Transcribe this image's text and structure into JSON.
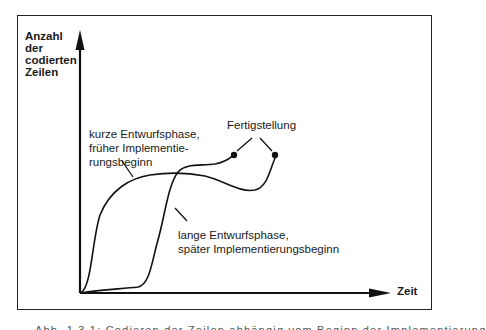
{
  "diagram": {
    "axes": {
      "y_label": "Anzahl der codierten Zeilen",
      "x_label": "Zeit"
    },
    "curves": [
      {
        "id": "kurze-entwurfsphase",
        "label": "kurze Entwurfsphase, früher Implementie-rungsbeginn",
        "label_lines": [
          "kurze Entwurfsphase,",
          "früher Implementie-",
          "rungsbeginn"
        ],
        "shape": "fast early rise, plateau with slight dip, then rise to completion"
      },
      {
        "id": "lange-entwurfsphase",
        "label": "lange Entwurfsphase, später Implementierungsbeginn",
        "label_lines": [
          "lange Entwurfsphase,",
          "später Implementierungsbeginn"
        ],
        "shape": "flat start, steep late rise, earlier completion"
      }
    ],
    "annotation": {
      "label": "Fertigstellung",
      "points": 2
    },
    "caption": "Abb. 1.3.1: Codieren der Zeilen abhängig vom Beginn der Implementierung"
  },
  "colors": {
    "line": "#111111",
    "frame": "#222222",
    "background": "#ffffff"
  }
}
